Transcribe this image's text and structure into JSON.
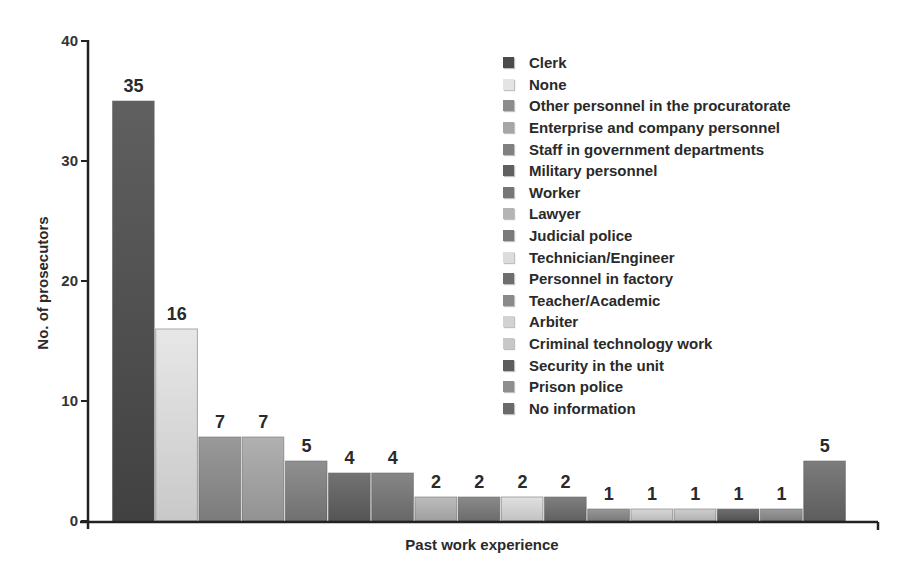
{
  "chart_data": {
    "type": "bar",
    "title": "",
    "xlabel": "Past work experience",
    "ylabel": "No. of prosecutors",
    "ylim": [
      0,
      40
    ],
    "yticks": [
      0,
      10,
      20,
      30,
      40
    ],
    "grid": false,
    "legend_position": "upper right (inside)",
    "categories": [
      "Clerk",
      "None",
      "Other personnel in the procuratorate",
      "Enterprise and company  personnel",
      "Staff in government departments",
      "Military personnel",
      "Worker",
      "Lawyer",
      "Judicial police",
      "Technician/Engineer",
      "Personnel in factory",
      "Teacher/Academic",
      "Arbiter",
      "Criminal technology work",
      "Security in the unit",
      "Prison police",
      "No information"
    ],
    "values": [
      35,
      16,
      7,
      7,
      5,
      4,
      4,
      2,
      2,
      2,
      2,
      1,
      1,
      1,
      1,
      1,
      5
    ],
    "colors": [
      "#4a4a4a",
      "#e4e4e4",
      "#8c8c8c",
      "#a6a6a6",
      "#808080",
      "#606060",
      "#767676",
      "#b4b4b4",
      "#7a7a7a",
      "#dcdcdc",
      "#6e6e6e",
      "#8a8a8a",
      "#d2d2d2",
      "#c8c8c8",
      "#5c5c5c",
      "#8e8e8e",
      "#6a6a6a"
    ]
  }
}
